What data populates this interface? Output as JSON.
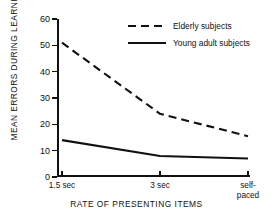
{
  "chart_data": {
    "type": "line",
    "title": "",
    "xlabel": "RATE OF PRESENTING ITEMS",
    "ylabel": "MEAN ERRORS DURING LEARNING",
    "categories": [
      "1.5 sec",
      "3 sec",
      "self-\npaced"
    ],
    "x": [
      0,
      1,
      2
    ],
    "ylim": [
      0,
      60
    ],
    "ytick_labels": [
      "0",
      "10",
      "20",
      "30",
      "40",
      "50",
      "60"
    ],
    "ytick_values": [
      0,
      10,
      20,
      30,
      40,
      50,
      60
    ],
    "grid": false,
    "legend_position": "top-right-inside",
    "series": [
      {
        "name": "Elderly subjects",
        "style": "dashed",
        "color": "#111111",
        "values": [
          51,
          24,
          15.5
        ]
      },
      {
        "name": "Young adult subjects",
        "style": "solid",
        "color": "#111111",
        "values": [
          14,
          8,
          7
        ]
      }
    ]
  },
  "axis": {
    "y_title": "MEAN ERRORS DURING LEARNING",
    "x_title": "RATE OF PRESENTING ITEMS"
  },
  "xtick_labels": [
    {
      "line1": "1.5 sec",
      "line2": ""
    },
    {
      "line1": "3 sec",
      "line2": ""
    },
    {
      "line1": "self-",
      "line2": "paced"
    }
  ],
  "legend": {
    "items": [
      {
        "label": "Elderly subjects",
        "style": "dashed"
      },
      {
        "label": "Young adult subjects",
        "style": "solid"
      }
    ]
  }
}
